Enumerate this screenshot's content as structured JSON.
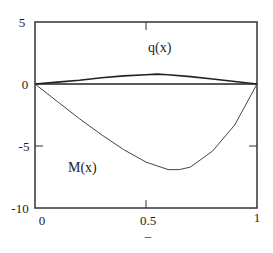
{
  "chart_data": {
    "type": "line",
    "title": "",
    "xlabel": "–",
    "ylabel": "",
    "xlim": [
      0,
      1
    ],
    "ylim": [
      -10,
      5
    ],
    "x_ticks": [
      0,
      0.5,
      1
    ],
    "x_tick_labels": [
      "0",
      "0.5",
      "1"
    ],
    "y_ticks": [
      5,
      0,
      -5,
      -10
    ],
    "y_tick_labels": [
      "5",
      "0",
      "-5",
      "-10"
    ],
    "grid": false,
    "legend": "none (inline curve labels)",
    "series": [
      {
        "name": "q(x)",
        "x": [
          0,
          0.1,
          0.2,
          0.3,
          0.4,
          0.5,
          0.55,
          0.6,
          0.7,
          0.8,
          0.9,
          1.0
        ],
        "values": [
          0,
          0.15,
          0.3,
          0.5,
          0.65,
          0.75,
          0.8,
          0.75,
          0.6,
          0.4,
          0.2,
          0
        ]
      },
      {
        "name": "M(x)",
        "x": [
          0,
          0.1,
          0.2,
          0.3,
          0.4,
          0.5,
          0.6,
          0.65,
          0.7,
          0.8,
          0.9,
          1.0
        ],
        "values": [
          0,
          -1.4,
          -2.8,
          -4.1,
          -5.3,
          -6.3,
          -6.9,
          -6.9,
          -6.7,
          -5.4,
          -3.3,
          0
        ]
      }
    ],
    "annotations": [
      {
        "text": "q(x)",
        "x": 0.55,
        "y": 3.0
      },
      {
        "text": "M(x)",
        "x": 0.2,
        "y": -6.3
      }
    ]
  },
  "labels": {
    "y_top": "5",
    "y_zero": "0",
    "y_mid": "-5",
    "y_bottom": "-10",
    "x_left": "0",
    "x_mid": "0.5",
    "x_right": "1",
    "x_axis_label": "–",
    "q_label": "q(x)",
    "m_label": "M(x)"
  }
}
